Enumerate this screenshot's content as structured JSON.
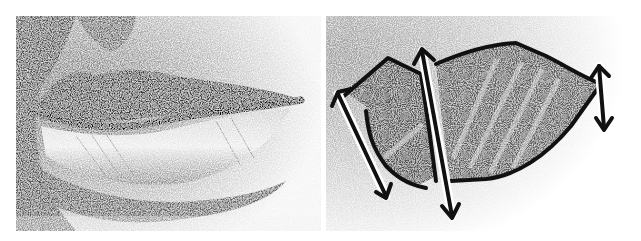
{
  "figure": {
    "panels": [
      {
        "id": "left",
        "label": "Shaded pencil drawing of lips"
      },
      {
        "id": "right",
        "label": "Simplified lip planes with height arrows"
      }
    ]
  },
  "colors": {
    "ink": "#111111",
    "dark_shade": "#4a4a4a",
    "mid_shade": "#7a7a7a",
    "light_shade": "#bdbdbd",
    "paper": "#ffffff"
  }
}
